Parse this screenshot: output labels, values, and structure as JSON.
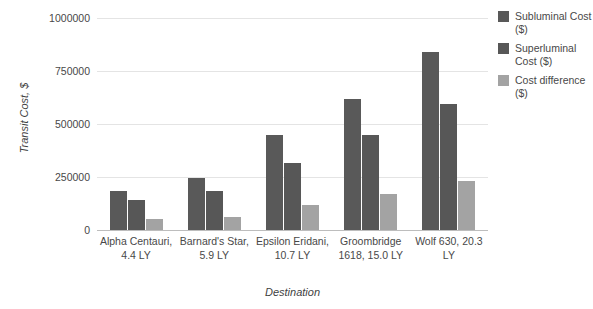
{
  "chart_data": {
    "type": "bar",
    "title": "",
    "xlabel": "Destination",
    "ylabel": "Transit Cost, $",
    "ylim": [
      0,
      1000000
    ],
    "ytick_labels": [
      "1000000",
      "750000",
      "500000",
      "250000",
      "0"
    ],
    "ytick_values": [
      1000000,
      750000,
      500000,
      250000,
      0
    ],
    "grid": true,
    "legend_position": "right",
    "categories": [
      "Alpha Centauri, 4.4 LY",
      "Barnard's Star, 5.9 LY",
      "Epsilon Eridani, 10.7 LY",
      "Groombridge 1618, 15.0 LY",
      "Wolf 630, 20.3 LY"
    ],
    "series": [
      {
        "name": "Subluminal Cost ($)",
        "color": "#595959",
        "values": [
          185000,
          245000,
          450000,
          620000,
          840000
        ]
      },
      {
        "name": "Superluminal Cost ($)",
        "color": "#575757",
        "values": [
          142000,
          185000,
          315000,
          450000,
          595000
        ]
      },
      {
        "name": "Cost difference ($)",
        "color": "#a3a3a3",
        "values": [
          52000,
          62000,
          120000,
          168000,
          233000
        ]
      }
    ]
  }
}
